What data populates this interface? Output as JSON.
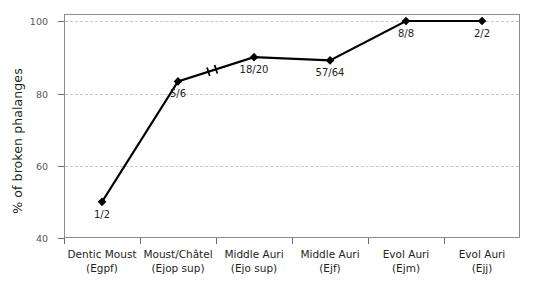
{
  "chart_data": {
    "type": "line",
    "title": "",
    "subtitle": "",
    "xlabel": "",
    "ylabel": "% of broken phalanges",
    "ylim": [
      40,
      100
    ],
    "yticks": [
      40,
      60,
      80,
      100
    ],
    "ytick_labels": [
      "40",
      "60",
      "80",
      "100"
    ],
    "grid": "horizontal dashed gridlines at y ticks",
    "legend": "none",
    "categories": [
      {
        "name": "Dentic Moust",
        "code": "(Egpf)"
      },
      {
        "name": "Moust/Châtel",
        "code": "(Ejop sup)"
      },
      {
        "name": "Middle Auri",
        "code": "(Ejo sup)"
      },
      {
        "name": "Middle Auri",
        "code": "(Ejf)"
      },
      {
        "name": "Evol Auri",
        "code": "(Ejm)"
      },
      {
        "name": "Evol Auri",
        "code": "(Ejj)"
      }
    ],
    "series": [
      {
        "name": "% of broken phalanges",
        "marker": "filled diamond",
        "color": "#000000",
        "values": [
          50.0,
          83.3,
          90.0,
          89.1,
          100.0,
          100.0
        ],
        "point_labels": [
          "1/2",
          "5/6",
          "18/20",
          "57/64",
          "8/8",
          "2/2"
        ],
        "label_positions": [
          "below",
          "below",
          "below",
          "below",
          "below",
          "below"
        ]
      }
    ],
    "annotations": [
      {
        "name": "axis-break-marks",
        "description": "pair of short perpendicular hatch marks on the line segment between 'Moust/Châtel (Ejop sup)' and 'Middle Auri (Ejo sup)'",
        "symbol": "//"
      }
    ],
    "colors": {
      "line": "#000000",
      "marker": "#000000",
      "grid": "#c9c9c9",
      "axis": "#8c8c8c",
      "tick_label": "#58585a",
      "text": "#231f20",
      "background": "#ffffff"
    }
  }
}
